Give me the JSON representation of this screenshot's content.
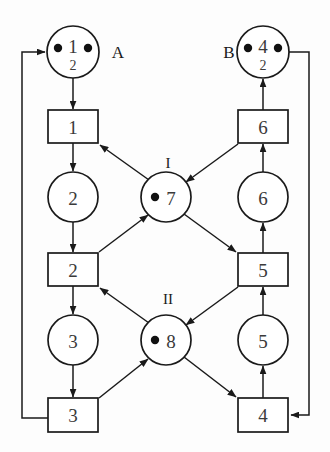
{
  "diagram": {
    "type": "petri-net",
    "colors": {
      "stroke": "#1a1a1a",
      "fill": "#ffffff",
      "token": "#111111",
      "label": "#3a3a3a"
    },
    "outer_labels": [
      {
        "id": "label-A",
        "text": "A",
        "x": 118,
        "y": 52
      },
      {
        "id": "label-B",
        "text": "B",
        "x": 229,
        "y": 52
      },
      {
        "id": "label-I",
        "text": "I",
        "x": 168,
        "y": 163
      },
      {
        "id": "label-II",
        "text": "II",
        "x": 168,
        "y": 299
      }
    ],
    "places": [
      {
        "id": "place-1",
        "label": "1",
        "cx": 73,
        "cy": 52,
        "r": 26,
        "tokens": 2,
        "token_style": "pair-side",
        "weight": "2",
        "outer_label": "A"
      },
      {
        "id": "place-2",
        "label": "2",
        "cx": 73,
        "cy": 197,
        "r": 25,
        "tokens": 0,
        "token_style": "none",
        "weight": "",
        "outer_label": ""
      },
      {
        "id": "place-3",
        "label": "3",
        "cx": 73,
        "cy": 340,
        "r": 25,
        "tokens": 0,
        "token_style": "none",
        "weight": "",
        "outer_label": ""
      },
      {
        "id": "place-4",
        "label": "4",
        "cx": 263,
        "cy": 52,
        "r": 26,
        "tokens": 2,
        "token_style": "pair-side",
        "weight": "2",
        "outer_label": "B"
      },
      {
        "id": "place-5",
        "label": "5",
        "cx": 263,
        "cy": 340,
        "r": 25,
        "tokens": 0,
        "token_style": "none",
        "weight": "",
        "outer_label": ""
      },
      {
        "id": "place-6",
        "label": "6",
        "cx": 263,
        "cy": 197,
        "r": 25,
        "tokens": 0,
        "token_style": "none",
        "weight": "",
        "outer_label": ""
      },
      {
        "id": "place-7",
        "label": "7",
        "cx": 166,
        "cy": 197,
        "r": 25,
        "tokens": 1,
        "token_style": "single-left",
        "weight": "",
        "outer_label": "I"
      },
      {
        "id": "place-8",
        "label": "8",
        "cx": 166,
        "cy": 340,
        "r": 25,
        "tokens": 1,
        "token_style": "single-left",
        "weight": "",
        "outer_label": "II"
      }
    ],
    "transitions": [
      {
        "id": "transition-1",
        "label": "1",
        "x": 48,
        "y": 110,
        "w": 50,
        "h": 33
      },
      {
        "id": "transition-2",
        "label": "2",
        "x": 48,
        "y": 253,
        "w": 50,
        "h": 33
      },
      {
        "id": "transition-3",
        "label": "3",
        "x": 48,
        "y": 398,
        "w": 50,
        "h": 34
      },
      {
        "id": "transition-4",
        "label": "4",
        "x": 238,
        "y": 398,
        "w": 50,
        "h": 34
      },
      {
        "id": "transition-5",
        "label": "5",
        "x": 238,
        "y": 253,
        "w": 50,
        "h": 33
      },
      {
        "id": "transition-6",
        "label": "6",
        "x": 238,
        "y": 110,
        "w": 50,
        "h": 33
      }
    ],
    "arcs": [
      {
        "id": "arc-place1-transition1",
        "from": "place-1",
        "to": "transition-1",
        "kind": "straight"
      },
      {
        "id": "arc-transition1-place2",
        "from": "transition-1",
        "to": "place-2",
        "kind": "straight"
      },
      {
        "id": "arc-place2-transition2",
        "from": "place-2",
        "to": "transition-2",
        "kind": "straight"
      },
      {
        "id": "arc-transition2-place3",
        "from": "transition-2",
        "to": "place-3",
        "kind": "straight"
      },
      {
        "id": "arc-place3-transition3",
        "from": "place-3",
        "to": "transition-3",
        "kind": "straight"
      },
      {
        "id": "arc-transition3-place1",
        "from": "transition-3",
        "to": "place-1",
        "kind": "outer-left-loop"
      },
      {
        "id": "arc-transition4-place5",
        "from": "transition-4",
        "to": "place-5",
        "kind": "straight"
      },
      {
        "id": "arc-place5-transition5",
        "from": "place-5",
        "to": "transition-5",
        "kind": "straight"
      },
      {
        "id": "arc-transition5-place6",
        "from": "transition-5",
        "to": "place-6",
        "kind": "straight"
      },
      {
        "id": "arc-place6-transition6",
        "from": "place-6",
        "to": "transition-6",
        "kind": "straight"
      },
      {
        "id": "arc-transition6-place4",
        "from": "transition-6",
        "to": "place-4",
        "kind": "straight"
      },
      {
        "id": "arc-place4-transition4",
        "from": "place-4",
        "to": "transition-4",
        "kind": "outer-right-loop"
      },
      {
        "id": "arc-place7-transition1",
        "from": "place-7",
        "to": "transition-1",
        "kind": "diagonal"
      },
      {
        "id": "arc-transition2-place7",
        "from": "transition-2",
        "to": "place-7",
        "kind": "diagonal"
      },
      {
        "id": "arc-transition6-place7",
        "from": "transition-6",
        "to": "place-7",
        "kind": "diagonal"
      },
      {
        "id": "arc-place7-transition5",
        "from": "place-7",
        "to": "transition-5",
        "kind": "diagonal"
      },
      {
        "id": "arc-place8-transition2",
        "from": "place-8",
        "to": "transition-2",
        "kind": "diagonal"
      },
      {
        "id": "arc-transition3-place8",
        "from": "transition-3",
        "to": "place-8",
        "kind": "diagonal"
      },
      {
        "id": "arc-transition5-place8",
        "from": "transition-5",
        "to": "place-8",
        "kind": "diagonal"
      },
      {
        "id": "arc-place8-transition4",
        "from": "place-8",
        "to": "transition-4",
        "kind": "diagonal"
      }
    ]
  }
}
